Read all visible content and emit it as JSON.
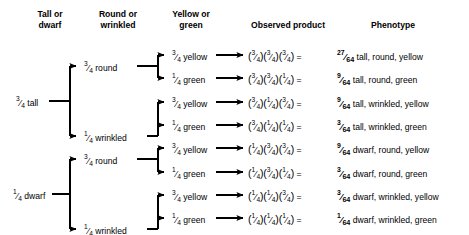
{
  "diagram": {
    "headers": [
      {
        "id": "col-trait1",
        "line1": "Tall or",
        "line2": "dwarf"
      },
      {
        "id": "col-trait2",
        "line1": "Round or",
        "line2": "wrinkled"
      },
      {
        "id": "col-trait3",
        "line1": "Yellow or",
        "line2": "green"
      },
      {
        "id": "col-product",
        "line1": "Observed product",
        "line2": ""
      },
      {
        "id": "col-phenotype",
        "line1": "Phenotype",
        "line2": ""
      }
    ],
    "level1": [
      {
        "num": "3",
        "den": "4",
        "label": "tall"
      },
      {
        "num": "1",
        "den": "4",
        "label": "dwarf"
      }
    ],
    "level2": [
      {
        "num": "3",
        "den": "4",
        "label": "round"
      },
      {
        "num": "1",
        "den": "4",
        "label": "wrinkled"
      },
      {
        "num": "3",
        "den": "4",
        "label": "round"
      },
      {
        "num": "1",
        "den": "4",
        "label": "wrinkled"
      }
    ],
    "level3": [
      {
        "num": "3",
        "den": "4",
        "label": "yellow"
      },
      {
        "num": "1",
        "den": "4",
        "label": "green"
      },
      {
        "num": "3",
        "den": "4",
        "label": "yellow"
      },
      {
        "num": "1",
        "den": "4",
        "label": "green"
      },
      {
        "num": "3",
        "den": "4",
        "label": "yellow"
      },
      {
        "num": "1",
        "den": "4",
        "label": "green"
      },
      {
        "num": "3",
        "den": "4",
        "label": "yellow"
      },
      {
        "num": "1",
        "den": "4",
        "label": "green"
      }
    ],
    "rows": [
      {
        "factors": [
          {
            "num": "3",
            "den": "4"
          },
          {
            "num": "3",
            "den": "4"
          },
          {
            "num": "3",
            "den": "4"
          }
        ],
        "equals": "=",
        "result": {
          "num": "27",
          "den": "64"
        },
        "phenotype": "tall, round, yellow"
      },
      {
        "factors": [
          {
            "num": "3",
            "den": "4"
          },
          {
            "num": "3",
            "den": "4"
          },
          {
            "num": "1",
            "den": "4"
          }
        ],
        "equals": "=",
        "result": {
          "num": "9",
          "den": "64"
        },
        "phenotype": "tall, round, green"
      },
      {
        "factors": [
          {
            "num": "3",
            "den": "4"
          },
          {
            "num": "1",
            "den": "4"
          },
          {
            "num": "3",
            "den": "4"
          }
        ],
        "equals": "=",
        "result": {
          "num": "9",
          "den": "64"
        },
        "phenotype": "tall, wrinkled, yellow"
      },
      {
        "factors": [
          {
            "num": "3",
            "den": "4"
          },
          {
            "num": "1",
            "den": "4"
          },
          {
            "num": "1",
            "den": "4"
          }
        ],
        "equals": "=",
        "result": {
          "num": "3",
          "den": "64"
        },
        "phenotype": "tall, wrinkled, green"
      },
      {
        "factors": [
          {
            "num": "1",
            "den": "4"
          },
          {
            "num": "3",
            "den": "4"
          },
          {
            "num": "3",
            "den": "4"
          }
        ],
        "equals": "=",
        "result": {
          "num": "9",
          "den": "64"
        },
        "phenotype": "dwarf, round, yellow"
      },
      {
        "factors": [
          {
            "num": "1",
            "den": "4"
          },
          {
            "num": "3",
            "den": "4"
          },
          {
            "num": "1",
            "den": "4"
          }
        ],
        "equals": "=",
        "result": {
          "num": "3",
          "den": "64"
        },
        "phenotype": "dwarf, round, green"
      },
      {
        "factors": [
          {
            "num": "1",
            "den": "4"
          },
          {
            "num": "1",
            "den": "4"
          },
          {
            "num": "3",
            "den": "4"
          }
        ],
        "equals": "=",
        "result": {
          "num": "3",
          "den": "64"
        },
        "phenotype": "dwarf, wrinkled, yellow"
      },
      {
        "factors": [
          {
            "num": "1",
            "den": "4"
          },
          {
            "num": "1",
            "den": "4"
          },
          {
            "num": "1",
            "den": "4"
          }
        ],
        "equals": "=",
        "result": {
          "num": "1",
          "den": "64"
        },
        "phenotype": "dwarf, wrinkled, green"
      }
    ],
    "colors": {
      "ink": "#000000",
      "background": "#ffffff"
    }
  }
}
